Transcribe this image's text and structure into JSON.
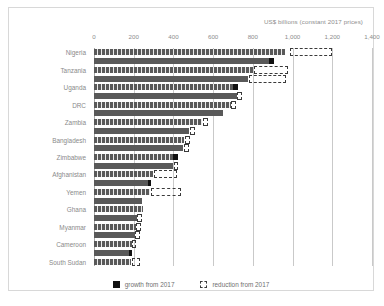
{
  "chart_data": {
    "type": "bar",
    "title": "",
    "axis_title": "US$ billions (constant 2017 prices)",
    "orientation": "horizontal",
    "xlabel": "US$ billions (constant 2017 prices)",
    "ylabel": "",
    "xlim": [
      0,
      1400
    ],
    "xticks": [
      0,
      200,
      400,
      600,
      800,
      1000,
      1200,
      1400
    ],
    "xticklabels": [
      "0",
      "200",
      "400",
      "600",
      "800",
      "1,000",
      "1,200",
      "1,400"
    ],
    "grid": "vertical",
    "legend_position": "bottom-center",
    "legend": [
      {
        "key": "growth",
        "label": "growth from 2017",
        "marker": "filled-square",
        "color": "#111111"
      },
      {
        "key": "reduction",
        "label": "reduction from 2017",
        "marker": "dashed-square",
        "color": "#3a3a3a"
      }
    ],
    "categories": [
      "Nigeria",
      "Tanzania",
      "Uganda",
      "DRC",
      "Zambia",
      "Bangladesh",
      "Zimbabwe",
      "Afghanistan",
      "Yemen",
      "Ghana",
      "Myanmar",
      "Cameroon",
      "South Sudan"
    ],
    "bars": [
      {
        "category": "Nigeria",
        "pair": 1,
        "base": 960,
        "growth": 0,
        "reduction_from": 985,
        "reduction_to": 1200
      },
      {
        "category": "Nigeria",
        "pair": 2,
        "base": 880,
        "growth": 25,
        "reduction_from": null,
        "reduction_to": null
      },
      {
        "category": "Tanzania",
        "pair": 1,
        "base": 800,
        "growth": 0,
        "reduction_from": 805,
        "reduction_to": 975
      },
      {
        "category": "Tanzania",
        "pair": 2,
        "base": 775,
        "growth": 0,
        "reduction_from": 780,
        "reduction_to": 965
      },
      {
        "category": "Uganda",
        "pair": 1,
        "base": 700,
        "growth": 25,
        "reduction_from": null,
        "reduction_to": null
      },
      {
        "category": "Uganda",
        "pair": 2,
        "base": 720,
        "growth": 0,
        "reduction_from": 722,
        "reduction_to": 745
      },
      {
        "category": "DRC",
        "pair": 1,
        "base": 690,
        "growth": 0,
        "reduction_from": 692,
        "reduction_to": 715
      },
      {
        "category": "DRC",
        "pair": 2,
        "base": 650,
        "growth": 0,
        "reduction_from": null,
        "reduction_to": null
      },
      {
        "category": "Zambia",
        "pair": 1,
        "base": 545,
        "growth": 0,
        "reduction_from": 548,
        "reduction_to": 572
      },
      {
        "category": "Zambia",
        "pair": 2,
        "base": 480,
        "growth": 0,
        "reduction_from": 482,
        "reduction_to": 508
      },
      {
        "category": "Bangladesh",
        "pair": 1,
        "base": 455,
        "growth": 0,
        "reduction_from": 457,
        "reduction_to": 482
      },
      {
        "category": "Bangladesh",
        "pair": 2,
        "base": 450,
        "growth": 0,
        "reduction_from": 452,
        "reduction_to": 480
      },
      {
        "category": "Zimbabwe",
        "pair": 1,
        "base": 400,
        "growth": 25,
        "reduction_from": null,
        "reduction_to": null
      },
      {
        "category": "Zimbabwe",
        "pair": 2,
        "base": 400,
        "growth": 0,
        "reduction_from": 402,
        "reduction_to": 425
      },
      {
        "category": "Afghanistan",
        "pair": 1,
        "base": 295,
        "growth": 0,
        "reduction_from": 300,
        "reduction_to": 420
      },
      {
        "category": "Afghanistan",
        "pair": 2,
        "base": 270,
        "growth": 18,
        "reduction_from": null,
        "reduction_to": null
      },
      {
        "category": "Yemen",
        "pair": 1,
        "base": 280,
        "growth": 0,
        "reduction_from": 285,
        "reduction_to": 440
      },
      {
        "category": "Yemen",
        "pair": 2,
        "base": 240,
        "growth": 0,
        "reduction_from": null,
        "reduction_to": null
      },
      {
        "category": "Ghana",
        "pair": 1,
        "base": 245,
        "growth": 0,
        "reduction_from": null,
        "reduction_to": null
      },
      {
        "category": "Ghana",
        "pair": 2,
        "base": 215,
        "growth": 0,
        "reduction_from": 217,
        "reduction_to": 240
      },
      {
        "category": "Myanmar",
        "pair": 1,
        "base": 212,
        "growth": 0,
        "reduction_from": 214,
        "reduction_to": 238
      },
      {
        "category": "Myanmar",
        "pair": 2,
        "base": 205,
        "growth": 0,
        "reduction_from": 207,
        "reduction_to": 232
      },
      {
        "category": "Cameroon",
        "pair": 1,
        "base": 190,
        "growth": 0,
        "reduction_from": 192,
        "reduction_to": 212
      },
      {
        "category": "Cameroon",
        "pair": 2,
        "base": 175,
        "growth": 14,
        "reduction_from": null,
        "reduction_to": null
      },
      {
        "category": "South Sudan",
        "pair": 1,
        "base": 185,
        "growth": 0,
        "reduction_from": 190,
        "reduction_to": 230
      }
    ]
  }
}
